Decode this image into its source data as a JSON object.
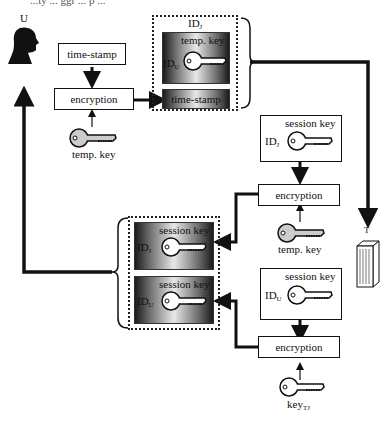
{
  "caption_clipped": "...ty ... ggr ... p ...",
  "user": {
    "label": "U",
    "icon": "person-silhouette-icon"
  },
  "server": {
    "label": "T",
    "icon": "server-tower-icon"
  },
  "top_left": {
    "timestamp_box": "time-stamp",
    "encryption_box": "encryption",
    "key_label": "temp. key"
  },
  "packet_top": {
    "container_label_main": "ID",
    "container_label_sub": "J",
    "inner_key_label": "temp. key",
    "inner_id_main": "ID",
    "inner_id_sub": "U",
    "timestamp_label": "time-stamp"
  },
  "right_column": {
    "session_box_j": {
      "key_label": "session key",
      "id_main": "ID",
      "id_sub": "J"
    },
    "encryption_1": "encryption",
    "temp_key_label": "temp. key",
    "session_box_u": {
      "key_label": "session key",
      "id_main": "ID",
      "id_sub": "U"
    },
    "encryption_2": "encryption",
    "key_tj_main": "key",
    "key_tj_sub": "TJ"
  },
  "packet_bottom": {
    "item_j": {
      "key_label": "session key",
      "id_main": "ID",
      "id_sub": "J"
    },
    "item_u": {
      "key_label": "session key",
      "id_main": "ID",
      "id_sub": "U"
    }
  },
  "colors": {
    "line": "#111111",
    "key_fill": "#cccccc",
    "key_fill_dark_bg": "#ffffff"
  }
}
